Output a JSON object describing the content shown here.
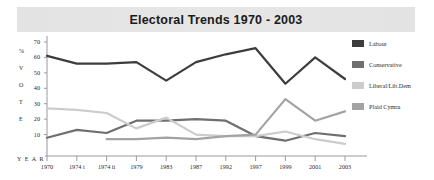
{
  "title": "Electoral Trends 1970 - 2003",
  "axis": {
    "y_word_label": "% V O T E",
    "y_word_chars": [
      "%",
      "V",
      "O",
      "T",
      "E"
    ],
    "x_word_label": "Y E A R",
    "y_ticks": [
      70,
      60,
      50,
      40,
      30,
      20,
      10
    ],
    "y_min": 0,
    "y_max": 70
  },
  "legend": {
    "position": "right",
    "items": [
      {
        "label": "Labour",
        "color": "#3d3d3d"
      },
      {
        "label": "Conservative",
        "color": "#6f6f6f"
      },
      {
        "label": "Liberal/Lib.Dem",
        "color": "#cccccc"
      },
      {
        "label": "Plaid Cymru",
        "color": "#a3a3a3"
      }
    ]
  },
  "chart_data": {
    "type": "line",
    "title": "Electoral Trends 1970 - 2003",
    "xlabel": "Y E A R",
    "ylabel": "% V O T E",
    "ylim": [
      0,
      70
    ],
    "grid": false,
    "legend_position": "right",
    "categories": [
      "1970",
      "1974 i",
      "1974 ii",
      "1979",
      "1983",
      "1987",
      "1992",
      "1997",
      "1999",
      "2001",
      "2003"
    ],
    "series": [
      {
        "name": "Labour",
        "color": "#3d3d3d",
        "values": [
          61,
          56,
          56,
          57,
          45,
          57,
          62,
          66,
          43,
          60,
          46
        ]
      },
      {
        "name": "Conservative",
        "color": "#6f6f6f",
        "values": [
          8,
          13,
          11,
          19,
          19,
          20,
          19,
          9,
          6,
          11,
          9
        ]
      },
      {
        "name": "Liberal/Lib.Dem",
        "color": "#cccccc",
        "values": [
          27,
          26,
          24,
          14,
          21,
          10,
          9,
          9,
          12,
          7,
          4
        ]
      },
      {
        "name": "Plaid Cymru",
        "color": "#a3a3a3",
        "values": [
          null,
          null,
          7,
          7,
          8,
          7,
          9,
          10,
          33,
          19,
          25
        ]
      }
    ]
  }
}
